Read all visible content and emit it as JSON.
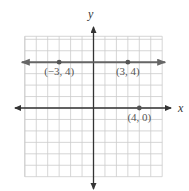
{
  "chart_data": {
    "type": "line",
    "title": "",
    "xlabel": "x",
    "ylabel": "y",
    "xlim": [
      -6,
      6
    ],
    "ylim": [
      -6,
      6
    ],
    "grid": true,
    "lines": [
      {
        "name": "horizontal line y = 4",
        "equation": "y = 4",
        "through": [
          [
            -3,
            4
          ],
          [
            3,
            4
          ]
        ],
        "arrows": "both"
      }
    ],
    "points": [
      {
        "x": -3,
        "y": 4,
        "label": "(−3, 4)"
      },
      {
        "x": 3,
        "y": 4,
        "label": "(3, 4)"
      },
      {
        "x": 4,
        "y": 0,
        "label": "(4, 0)"
      }
    ],
    "colors": {
      "grid": "#cccccc",
      "axes": "#333333",
      "line": "#666666",
      "point": "#555555"
    }
  }
}
